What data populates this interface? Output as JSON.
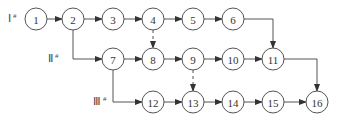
{
  "diagram": {
    "row_labels": [
      {
        "id": "row-1",
        "text": "Ⅰ",
        "sup": "#",
        "x": 8,
        "y": 22
      },
      {
        "id": "row-2",
        "text": "Ⅱ",
        "sup": "#",
        "x": 48,
        "y": 62
      },
      {
        "id": "row-3",
        "text": "Ⅲ",
        "sup": "#",
        "x": 93,
        "y": 105
      }
    ],
    "nodes": [
      {
        "id": "1",
        "label": "1",
        "x": 36,
        "y": 19
      },
      {
        "id": "2",
        "label": "2",
        "x": 73,
        "y": 19
      },
      {
        "id": "3",
        "label": "3",
        "x": 113,
        "y": 19
      },
      {
        "id": "4",
        "label": "4",
        "x": 153,
        "y": 19
      },
      {
        "id": "5",
        "label": "5",
        "x": 193,
        "y": 19
      },
      {
        "id": "6",
        "label": "6",
        "x": 233,
        "y": 19
      },
      {
        "id": "7",
        "label": "7",
        "x": 113,
        "y": 59
      },
      {
        "id": "8",
        "label": "8",
        "x": 153,
        "y": 59
      },
      {
        "id": "9",
        "label": "9",
        "x": 193,
        "y": 59
      },
      {
        "id": "10",
        "label": "10",
        "x": 233,
        "y": 59
      },
      {
        "id": "11",
        "label": "11",
        "x": 273,
        "y": 59
      },
      {
        "id": "12",
        "label": "12",
        "x": 153,
        "y": 102
      },
      {
        "id": "13",
        "label": "13",
        "x": 193,
        "y": 102
      },
      {
        "id": "14",
        "label": "14",
        "x": 233,
        "y": 102
      },
      {
        "id": "15",
        "label": "15",
        "x": 273,
        "y": 102
      },
      {
        "id": "16",
        "label": "16",
        "x": 317,
        "y": 102
      }
    ],
    "edges": [
      {
        "from": "1",
        "to": "2",
        "style": "solid"
      },
      {
        "from": "2",
        "to": "3",
        "style": "solid"
      },
      {
        "from": "3",
        "to": "4",
        "style": "solid"
      },
      {
        "from": "4",
        "to": "5",
        "style": "solid"
      },
      {
        "from": "5",
        "to": "6",
        "style": "solid"
      },
      {
        "from": "2",
        "to": "7",
        "style": "solid",
        "route": "down-right"
      },
      {
        "from": "7",
        "to": "8",
        "style": "solid"
      },
      {
        "from": "8",
        "to": "9",
        "style": "solid"
      },
      {
        "from": "9",
        "to": "10",
        "style": "solid"
      },
      {
        "from": "10",
        "to": "11",
        "style": "solid"
      },
      {
        "from": "6",
        "to": "11",
        "style": "solid",
        "route": "right-down"
      },
      {
        "from": "4",
        "to": "8",
        "style": "dashed"
      },
      {
        "from": "7",
        "to": "12",
        "style": "solid",
        "route": "down-right"
      },
      {
        "from": "9",
        "to": "13",
        "style": "dashed"
      },
      {
        "from": "12",
        "to": "13",
        "style": "solid"
      },
      {
        "from": "13",
        "to": "14",
        "style": "solid"
      },
      {
        "from": "14",
        "to": "15",
        "style": "solid"
      },
      {
        "from": "15",
        "to": "16",
        "style": "solid"
      },
      {
        "from": "11",
        "to": "16",
        "style": "solid",
        "route": "right-down"
      }
    ],
    "colors": {
      "stroke": "#555555",
      "text": "#333333",
      "background": "#ffffff"
    }
  }
}
